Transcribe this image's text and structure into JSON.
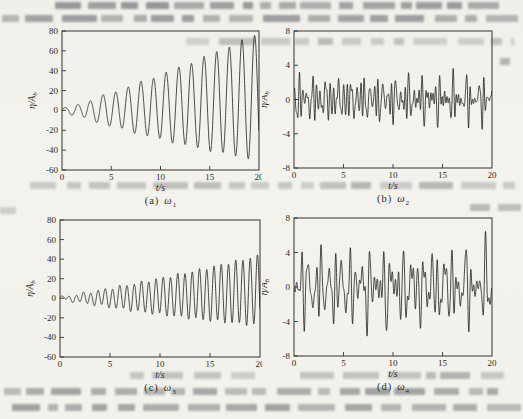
{
  "chart_data": [
    {
      "id": "a",
      "type": "line",
      "caption": {
        "prefix": "(a)",
        "symbol": "ω",
        "sub": "1"
      },
      "xlabel": "t/s",
      "ylabel": {
        "main": "η/A",
        "sub": "b"
      },
      "xlim": [
        0,
        20
      ],
      "ylim": [
        -60,
        80
      ],
      "xticks": [
        0,
        5,
        10,
        15,
        20
      ],
      "yticks": [
        80,
        60,
        40,
        20,
        0,
        -20,
        -40,
        -60
      ],
      "grid": false,
      "signal": {
        "kind": "growing",
        "frequency_hz": 0.78,
        "amp_base": 1.0,
        "amp_growth_per_s": 3.15,
        "bias_quadratic": 0.035,
        "secondary": {
          "amp": 1.0,
          "freq_hz": 0.5,
          "phase": 1.0
        },
        "peak_at_20s": 78,
        "trough_at_20s": -50
      }
    },
    {
      "id": "b",
      "type": "line",
      "caption": {
        "prefix": "(b)",
        "symbol": "ω",
        "sub": "2"
      },
      "xlabel": "t/s",
      "ylabel": {
        "main": "η/A",
        "sub": "b"
      },
      "xlim": [
        0,
        20
      ],
      "ylim": [
        -8,
        8
      ],
      "xticks": [
        0,
        5,
        10,
        15,
        20
      ],
      "yticks": [
        8,
        4,
        0,
        -4,
        -8
      ],
      "grid": false,
      "signal": {
        "kind": "irregular",
        "typical_peak": 3.5,
        "components": [
          {
            "amp": 1.1,
            "freq_hz": 2.25,
            "phase": 0.6
          },
          {
            "amp": 0.85,
            "freq_hz": 1.55,
            "phase": 2.1
          },
          {
            "amp": 0.75,
            "freq_hz": 2.9,
            "phase": 4.2
          },
          {
            "amp": 0.6,
            "freq_hz": 3.55,
            "phase": 1.3
          },
          {
            "amp": 0.45,
            "freq_hz": 0.85,
            "phase": 3.0
          },
          {
            "amp": 0.35,
            "freq_hz": 4.3,
            "phase": 5.5
          }
        ]
      }
    },
    {
      "id": "c",
      "type": "line",
      "caption": {
        "prefix": "(c)",
        "symbol": "ω",
        "sub": "3"
      },
      "xlabel": "t/s",
      "ylabel": {
        "main": "η/A",
        "sub": "b"
      },
      "xlim": [
        0,
        20
      ],
      "ylim": [
        -60,
        80
      ],
      "xticks": [
        0,
        5,
        10,
        15,
        20
      ],
      "yticks": [
        80,
        60,
        40,
        20,
        0,
        -20,
        -40,
        -60
      ],
      "grid": false,
      "signal": {
        "kind": "growing",
        "frequency_hz": 1.38,
        "amp_base": 0.8,
        "amp_growth_per_s": 1.75,
        "bias_quadratic": 0.02,
        "secondary": {
          "amp": 1.4,
          "freq_hz": 0.52,
          "phase": 0.4
        },
        "peak_at_20s": 44,
        "trough_at_20s": -28
      }
    },
    {
      "id": "d",
      "type": "line",
      "caption": {
        "prefix": "(d)",
        "symbol": "ω",
        "sub": "4"
      },
      "xlabel": "t/s",
      "ylabel": {
        "main": "η/A",
        "sub": "b"
      },
      "xlim": [
        0,
        20
      ],
      "ylim": [
        -8,
        8
      ],
      "xticks": [
        0,
        5,
        10,
        15,
        20
      ],
      "yticks": [
        8,
        4,
        0,
        -4,
        -8
      ],
      "grid": false,
      "signal": {
        "kind": "irregular",
        "typical_peak": 5.5,
        "components": [
          {
            "amp": 1.9,
            "freq_hz": 1.45,
            "phase": 1.0
          },
          {
            "amp": 1.5,
            "freq_hz": 2.05,
            "phase": 3.7
          },
          {
            "amp": 1.2,
            "freq_hz": 0.95,
            "phase": 5.2
          },
          {
            "amp": 0.9,
            "freq_hz": 2.65,
            "phase": 0.3
          },
          {
            "amp": 0.7,
            "freq_hz": 3.3,
            "phase": 2.6
          },
          {
            "amp": 0.5,
            "freq_hz": 0.55,
            "phase": 4.4
          }
        ]
      }
    }
  ],
  "style": {
    "line_color": "#1c1c1a",
    "axis_color": "#34322d",
    "text_color": "#2b2a26",
    "paper_color": "#f2f1ec"
  }
}
